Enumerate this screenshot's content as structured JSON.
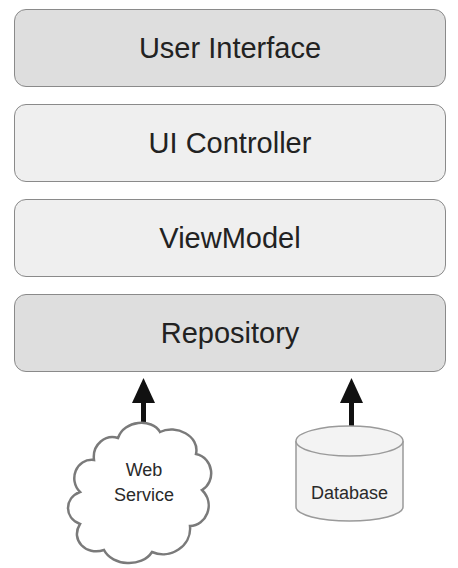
{
  "diagram": {
    "layers": [
      {
        "label": "User Interface",
        "shade": "dark"
      },
      {
        "label": "UI Controller",
        "shade": "light"
      },
      {
        "label": "ViewModel",
        "shade": "light"
      },
      {
        "label": "Repository",
        "shade": "dark"
      }
    ],
    "sources": [
      {
        "label_line1": "Web",
        "label_line2": "Service",
        "shape": "cloud",
        "arrow_to": "Repository"
      },
      {
        "label": "Database",
        "shape": "cylinder",
        "arrow_to": "Repository"
      }
    ],
    "colors": {
      "dark_fill": "#dedede",
      "light_fill": "#efefef",
      "border": "#8a8a8a",
      "arrow": "#111111",
      "text": "#222222"
    }
  }
}
